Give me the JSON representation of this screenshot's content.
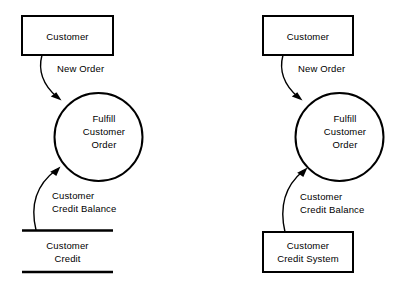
{
  "diagram": {
    "type": "data-flow-diagram",
    "background_color": "#ffffff",
    "line_color": "#000000",
    "variants": [
      {
        "id": "left",
        "name": "data-store-variant",
        "source_entity": {
          "label": "Customer",
          "shape": "rectangle"
        },
        "process": {
          "line1": "Fulfill",
          "line2": "Customer",
          "line3": "Order",
          "shape": "circle"
        },
        "data_store": {
          "line1": "Customer",
          "line2": "Credit",
          "shape": "open-ended-data-store"
        },
        "flows": [
          {
            "label": "New Order",
            "from": "Customer",
            "to": "Fulfill Customer Order"
          },
          {
            "label_line1": "Customer",
            "label_line2": "Credit Balance",
            "from": "Customer Credit",
            "to": "Fulfill Customer Order"
          }
        ]
      },
      {
        "id": "right",
        "name": "external-entity-variant",
        "source_entity": {
          "label": "Customer",
          "shape": "rectangle"
        },
        "process": {
          "line1": "Fulfill",
          "line2": "Customer",
          "line3": "Order",
          "shape": "circle"
        },
        "data_store": {
          "line1": "Customer",
          "line2": "Credit System",
          "shape": "rectangle"
        },
        "flows": [
          {
            "label": "New Order",
            "from": "Customer",
            "to": "Fulfill Customer Order"
          },
          {
            "label_line1": "Customer",
            "label_line2": "Credit Balance",
            "from": "Customer Credit System",
            "to": "Fulfill Customer Order"
          }
        ]
      }
    ]
  }
}
